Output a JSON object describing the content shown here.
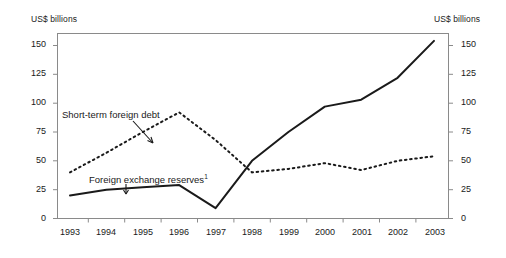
{
  "chart_data": {
    "type": "line",
    "title": "",
    "subtitle": "",
    "xlabel": "",
    "ylabel": "US$ billions",
    "ylabel_right": "US$ billions",
    "categories": [
      "1993",
      "1994",
      "1995",
      "1996",
      "1997",
      "1998",
      "1999",
      "2000",
      "2001",
      "2002",
      "2003"
    ],
    "x": [
      1993,
      1994,
      1995,
      1996,
      1997,
      1998,
      1999,
      2000,
      2001,
      2002,
      2003
    ],
    "xlim": [
      1993,
      2003
    ],
    "ylim": [
      0,
      150
    ],
    "y_ticks": [
      0,
      25,
      50,
      75,
      100,
      125,
      150
    ],
    "y_ticks_right": [
      0,
      25,
      50,
      75,
      100,
      125,
      150
    ],
    "grid": false,
    "legend": "inline-annotations",
    "series": [
      {
        "name": "Short-term foreign debt",
        "style": "dotted",
        "color": "#1a1a1a",
        "values": [
          40,
          57,
          75,
          92,
          68,
          40,
          43,
          48,
          42,
          50,
          54
        ]
      },
      {
        "name": "Foreign exchange reserves",
        "style": "solid",
        "color": "#1a1a1a",
        "values": [
          20,
          25,
          27,
          29,
          9,
          50,
          75,
          97,
          103,
          122,
          154
        ]
      }
    ],
    "annotations": [
      {
        "name": "short-term-foreign-debt-label",
        "text": "Short-term foreign debt",
        "points_to_series": "Short-term foreign debt",
        "has_arrow": true
      },
      {
        "name": "foreign-exchange-reserves-label",
        "text": "Foreign exchange reserves",
        "footnote_marker": "1",
        "points_to_series": "Foreign exchange reserves",
        "has_arrow": true
      }
    ]
  },
  "axes": {
    "left_unit": "US$ billions",
    "right_unit": "US$ billions",
    "y_tick_labels": [
      "150",
      "125",
      "100",
      "75",
      "50",
      "25",
      "0"
    ],
    "x_tick_labels": [
      "1993",
      "1994",
      "1995",
      "1996",
      "1997",
      "1998",
      "1999",
      "2000",
      "2001",
      "2002",
      "2003"
    ]
  },
  "colors": {
    "line": "#1a1a1a",
    "frame": "#8a8a8a",
    "background": "#ffffff",
    "text": "#1a1a1a"
  }
}
